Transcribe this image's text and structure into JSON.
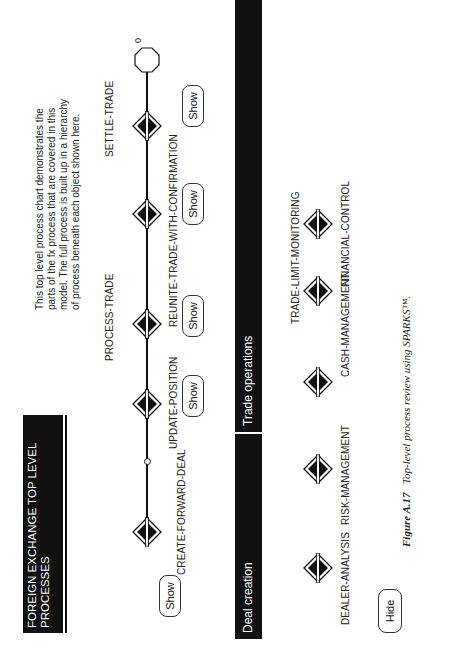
{
  "title": "FOREIGN EXCHANGE TOP LEVEL PROCESSES",
  "description": "This top level process chart demonstrates the parts of the fx process that are covered in this model.  The full process is built up in a hierarchy of process beneath each object shown here.",
  "main_flow": {
    "processes": [
      {
        "label": "CREATE-FORWARD-DEAL",
        "label_position": "below",
        "has_show_button": true
      },
      {
        "label": "UPDATE-POSITION",
        "label_position": "below",
        "has_show_button": true
      },
      {
        "label": "PROCESS-TRADE",
        "label_position": "above",
        "has_show_button": true
      },
      {
        "label": "REUNITE-TRADE-WITH-CONFIRMATION",
        "label_position": "below",
        "has_show_button": true
      },
      {
        "label": "SETTLE-TRADE",
        "label_position": "above",
        "has_show_button": false
      }
    ],
    "end_node_label": "0",
    "show_label": "Show"
  },
  "sections": {
    "deal_creation": "Deal creation",
    "trade_operations": "Trade operations"
  },
  "support_processes": [
    {
      "label": "DEALER-ANALYSIS"
    },
    {
      "label": "RISK-MANAGEMENT"
    },
    {
      "label": "CASH-MANAGEMENT"
    },
    {
      "label": "TRADE-LIMIT-MONITORING"
    },
    {
      "label": "FINANCIAL-CONTROL"
    }
  ],
  "hide_label": "Hide",
  "caption": {
    "figure": "Figure A.17",
    "text": "Top-level process review using SPARKS™."
  },
  "icons": {
    "process_node": "diamond-process-icon",
    "end_node": "octagon-end-icon",
    "junction": "small-circle-junction-icon"
  }
}
